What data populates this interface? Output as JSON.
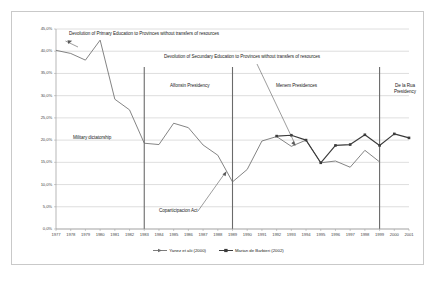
{
  "chart_data": {
    "type": "line",
    "title": "",
    "xlabel": "",
    "ylabel": "",
    "ylim": [
      0,
      45
    ],
    "ytick_labels": [
      "45,0%",
      "40,0%",
      "35,0%",
      "30,0%",
      "25,0%",
      "20,0%",
      "15,0%",
      "10,0%",
      "5,0%",
      "0,0%"
    ],
    "ytick_values": [
      45,
      40,
      35,
      30,
      25,
      20,
      15,
      10,
      5,
      0
    ],
    "grid": true,
    "legend_position": "bottom",
    "categories": [
      1977,
      1978,
      1979,
      1980,
      1981,
      1982,
      1983,
      1984,
      1985,
      1986,
      1987,
      1988,
      1989,
      1990,
      1991,
      1992,
      1993,
      1994,
      1995,
      1996,
      1997,
      1998,
      1999,
      2000,
      2001
    ],
    "xtick_labels": [
      "1977",
      "1978",
      "1979",
      "1980",
      "1981",
      "1982",
      "1983",
      "1984",
      "1985",
      "1986",
      "1987",
      "1988",
      "1989",
      "1990",
      "1991",
      "1992",
      "1993",
      "1994",
      "1995",
      "1996",
      "1997",
      "1998",
      "1999",
      "2000",
      "2001"
    ],
    "series": [
      {
        "name": "Yanez et alii (2000)",
        "color": "#6e6e6e",
        "x": [
          1977,
          1978,
          1979,
          1980,
          1981,
          1982,
          1983,
          1984,
          1985,
          1986,
          1987,
          1988,
          1989,
          1990,
          1991,
          1992,
          1993,
          1994,
          1995,
          1996,
          1997,
          1998,
          1999
        ],
        "values": [
          40.2,
          39.5,
          38.0,
          42.5,
          29.2,
          26.8,
          19.3,
          19.0,
          23.8,
          22.8,
          18.9,
          16.6,
          10.6,
          13.4,
          19.8,
          20.8,
          18.6,
          20.0,
          14.9,
          15.3,
          13.9,
          17.7,
          15.1
        ]
      },
      {
        "name": "Marian de Barbieri (2002)",
        "color": "#3b3b3b",
        "x": [
          1992,
          1993,
          1994,
          1995,
          1996,
          1997,
          1998,
          1999,
          2000,
          2001
        ],
        "values": [
          20.9,
          21.1,
          20.0,
          14.9,
          18.8,
          19.0,
          21.2,
          18.8,
          21.4,
          20.5
        ]
      }
    ],
    "event_lines": [
      {
        "name": "military-to-alfonsin",
        "x": 1983
      },
      {
        "name": "alfonsin-to-menem",
        "x": 1989
      },
      {
        "name": "menem-to-delarua",
        "x": 1999
      }
    ],
    "annotations": {
      "primary_education": "Devolution of Primary Education to Provinces without transfers of resources",
      "secundary_education": "Devolution of Secundary Education to Provinces without transfers of resources",
      "military_dictatorship": "Military dictatorship",
      "alfonsin": "Alfonsin Presidency",
      "menem": "Menem Presidences",
      "delarua": "De la Rua Presidency",
      "coparticipacion": "Coparticipacion Act"
    }
  }
}
